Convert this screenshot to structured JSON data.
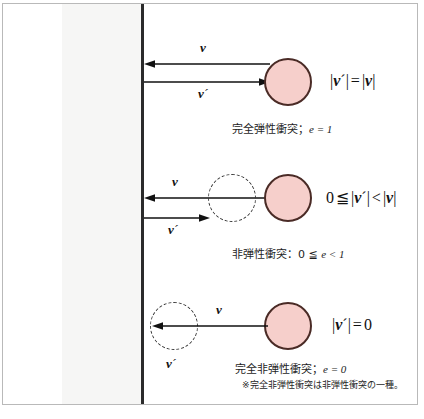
{
  "figure": {
    "wall_color": "#2b2b2b",
    "ball_fill": "#f6cfcb",
    "ball_stroke": "#4a2b26"
  },
  "rows": [
    {
      "id": "perfectly-elastic",
      "incoming_label": "v",
      "incoming_prime": "",
      "outgoing_label": "v",
      "outgoing_prime": "´",
      "formula": {
        "lhs_abs_open": "|",
        "lhs_vec": "v",
        "lhs_prime": "´",
        "lhs_abs_close": "|",
        "operator": "=",
        "rhs_abs_open": "|",
        "rhs_vec": "v",
        "rhs_abs_close": "|",
        "full": "|v´| = |v|"
      },
      "caption_text": "完全弾性衝突；",
      "caption_symbol": "e",
      "caption_value": " = 1",
      "has_ghost_ball": false
    },
    {
      "id": "inelastic",
      "incoming_label": "v",
      "incoming_prime": "",
      "outgoing_label": "v",
      "outgoing_prime": "´",
      "formula": {
        "zero": "0",
        "leq": "≦",
        "lhs_abs_open": "|",
        "lhs_vec": "v",
        "lhs_prime": "´",
        "lhs_abs_close": "|",
        "operator": "<",
        "rhs_abs_open": "|",
        "rhs_vec": "v",
        "rhs_abs_close": "|",
        "full": "0 ≦ |v´| < |v|"
      },
      "caption_text": "非弾性衝突：0 ≦ ",
      "caption_symbol": "e",
      "caption_value": " < 1",
      "has_ghost_ball": true
    },
    {
      "id": "perfectly-inelastic",
      "incoming_label": "v",
      "incoming_prime": "",
      "outgoing_label": "v",
      "outgoing_prime": "´",
      "formula": {
        "lhs_abs_open": "|",
        "lhs_vec": "v",
        "lhs_prime": "´",
        "lhs_abs_close": "|",
        "operator": "=",
        "rhs_value": "0",
        "full": "|v´| = 0"
      },
      "caption_text": "完全非弾性衝突；",
      "caption_symbol": "e",
      "caption_value": " = 0",
      "has_ghost_ball": true
    }
  ],
  "footnote": "※完全非弾性衝突は非弾性衝突の一種。"
}
